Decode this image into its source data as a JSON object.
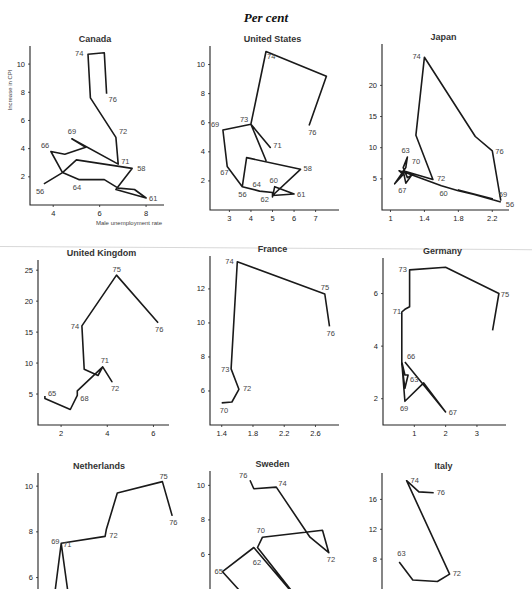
{
  "page": {
    "title": "Per cent"
  },
  "chart_data": [
    {
      "type": "line",
      "title": "Canada",
      "xlabel": "Male unemployment rate",
      "ylabel": "Increase in CPI",
      "xticks": [
        4,
        6,
        8
      ],
      "yticks": [
        2,
        4,
        6,
        8,
        10
      ],
      "xlim": [
        3,
        8.6
      ],
      "ylim": [
        0,
        11
      ],
      "box": [
        30,
        50,
        160,
        205
      ],
      "points": [
        [
          3.6,
          1.5
        ],
        [
          4.4,
          2.3
        ],
        [
          5.0,
          3.2
        ],
        [
          7.4,
          2.6
        ],
        [
          6.7,
          1.1
        ],
        [
          8.0,
          0.5
        ],
        [
          7.5,
          1.1
        ],
        [
          6.8,
          1.2
        ],
        [
          6.2,
          1.8
        ],
        [
          5.1,
          1.8
        ],
        [
          4.4,
          2.3
        ],
        [
          3.9,
          3.8
        ],
        [
          4.5,
          3.6
        ],
        [
          5.4,
          4.1
        ],
        [
          4.8,
          4.7
        ],
        [
          6.8,
          2.9
        ],
        [
          6.7,
          4.8
        ],
        [
          5.6,
          7.6
        ],
        [
          5.5,
          10.7
        ],
        [
          6.2,
          10.8
        ],
        [
          6.3,
          7.9
        ]
      ],
      "labels": [
        [
          "56",
          3.6,
          1.5,
          -8,
          10
        ],
        [
          "58",
          7.4,
          2.6,
          5,
          3
        ],
        [
          "61",
          8.0,
          0.5,
          3,
          3
        ],
        [
          "64",
          5.1,
          1.8,
          -6,
          10
        ],
        [
          "66",
          3.9,
          3.8,
          -10,
          -3
        ],
        [
          "69",
          4.8,
          4.7,
          -4,
          -5
        ],
        [
          "71",
          6.8,
          2.9,
          3,
          0
        ],
        [
          "72",
          6.7,
          4.8,
          3,
          -3
        ],
        [
          "74",
          5.5,
          10.7,
          -13,
          2
        ],
        [
          "76",
          6.3,
          7.9,
          2,
          8
        ]
      ]
    },
    {
      "type": "line",
      "title": "United States",
      "xlabel": "",
      "ylabel": "",
      "xticks": [
        3,
        4,
        5,
        6,
        7
      ],
      "yticks": [
        2,
        4,
        6,
        8,
        10
      ],
      "xlim": [
        2.1,
        7.9
      ],
      "ylim": [
        0,
        11
      ],
      "box": [
        210,
        50,
        335,
        210
      ],
      "points": [
        [
          3.6,
          1.6
        ],
        [
          3.8,
          3.6
        ],
        [
          6.3,
          2.8
        ],
        [
          5.0,
          1.0
        ],
        [
          6.0,
          1.1
        ],
        [
          5.1,
          1.6
        ],
        [
          5.0,
          0.9
        ],
        [
          5.0,
          1.2
        ],
        [
          4.4,
          1.3
        ],
        [
          3.6,
          1.6
        ],
        [
          2.9,
          3.0
        ],
        [
          2.7,
          5.5
        ],
        [
          4.0,
          5.9
        ],
        [
          4.9,
          4.3
        ],
        [
          4.0,
          5.9
        ],
        [
          4.7,
          3.4
        ],
        [
          4.0,
          5.9
        ],
        [
          4.7,
          10.9
        ],
        [
          7.5,
          9.2
        ],
        [
          6.7,
          5.8
        ]
      ],
      "labels": [
        [
          "56",
          3.6,
          1.6,
          -4,
          10
        ],
        [
          "58",
          6.3,
          2.8,
          3,
          2
        ],
        [
          "60",
          5.0,
          1.6,
          -3,
          -4
        ],
        [
          "61",
          6.0,
          1.1,
          3,
          3
        ],
        [
          "62",
          5.0,
          0.9,
          -12,
          5
        ],
        [
          "64",
          4.4,
          1.3,
          -7,
          -4
        ],
        [
          "67",
          2.9,
          3.0,
          -7,
          9
        ],
        [
          "69",
          2.7,
          5.5,
          -12,
          -3
        ],
        [
          "71",
          4.9,
          4.3,
          3,
          1
        ],
        [
          "73",
          4.0,
          5.9,
          -11,
          -2
        ],
        [
          "74",
          4.7,
          10.9,
          1,
          8
        ],
        [
          "76",
          6.7,
          5.8,
          -1,
          9
        ]
      ]
    },
    {
      "type": "line",
      "title": "Japan",
      "xlabel": "",
      "ylabel": "",
      "xticks": [
        1.0,
        1.4,
        1.8,
        2.2
      ],
      "yticks": [
        5,
        10,
        15,
        20
      ],
      "xlim": [
        0.9,
        2.35
      ],
      "ylim": [
        0,
        26
      ],
      "box": [
        382,
        48,
        505,
        210
      ],
      "points": [
        [
          2.3,
          1.3
        ],
        [
          1.8,
          3.2
        ],
        [
          2.2,
          1.8
        ],
        [
          1.8,
          3.1
        ],
        [
          1.6,
          3.9
        ],
        [
          1.2,
          5.9
        ],
        [
          1.1,
          6.3
        ],
        [
          1.15,
          5.7
        ],
        [
          1.05,
          4.2
        ],
        [
          1.18,
          6.8
        ],
        [
          1.2,
          8.5
        ],
        [
          1.15,
          6.8
        ],
        [
          1.2,
          5.2
        ],
        [
          1.25,
          5.6
        ],
        [
          1.18,
          4.3
        ],
        [
          1.15,
          6.3
        ],
        [
          1.5,
          4.9
        ],
        [
          1.3,
          12.0
        ],
        [
          1.4,
          24.5
        ],
        [
          2.0,
          11.8
        ],
        [
          2.2,
          9.5
        ],
        [
          2.3,
          1.5
        ]
      ],
      "labels": [
        [
          "56",
          2.3,
          1.5,
          5,
          6
        ],
        [
          "59",
          2.3,
          1.5,
          -2,
          -4
        ],
        [
          "60",
          1.6,
          3.9,
          -2,
          10
        ],
        [
          "63",
          1.2,
          8.5,
          -6,
          -4
        ],
        [
          "67",
          1.15,
          4.3,
          -5,
          10
        ],
        [
          "70",
          1.18,
          6.8,
          6,
          -4
        ],
        [
          "72",
          1.5,
          4.9,
          4,
          2
        ],
        [
          "74",
          1.4,
          24.5,
          -12,
          2
        ],
        [
          "76",
          2.2,
          9.5,
          3,
          3
        ]
      ]
    },
    {
      "type": "line",
      "title": "United Kingdom",
      "xlabel": "",
      "ylabel": "",
      "xticks": [
        2,
        4,
        6
      ],
      "yticks": [
        5,
        10,
        15,
        20,
        25
      ],
      "xlim": [
        1.0,
        6.5
      ],
      "ylim": [
        0,
        26
      ],
      "box": [
        38,
        264,
        165,
        425
      ],
      "points": [
        [
          1.3,
          4.7
        ],
        [
          1.3,
          4.3
        ],
        [
          2.4,
          2.5
        ],
        [
          2.7,
          4.8
        ],
        [
          2.7,
          5.5
        ],
        [
          3.8,
          9.4
        ],
        [
          4.2,
          7.0
        ],
        [
          3.8,
          9.4
        ],
        [
          3.6,
          8.0
        ],
        [
          3.0,
          9.0
        ],
        [
          2.9,
          16.0
        ],
        [
          4.4,
          24.2
        ],
        [
          6.2,
          16.5
        ]
      ],
      "labels": [
        [
          "65",
          1.3,
          4.7,
          3,
          0
        ],
        [
          "68",
          2.7,
          4.8,
          3,
          6
        ],
        [
          "71",
          3.8,
          9.4,
          -2,
          -4
        ],
        [
          "72",
          4.2,
          7.0,
          -1,
          9
        ],
        [
          "74",
          2.9,
          16.0,
          -11,
          3
        ],
        [
          "75",
          4.4,
          24.2,
          -4,
          -3
        ],
        [
          "76",
          6.2,
          16.5,
          -3,
          9
        ]
      ]
    },
    {
      "type": "line",
      "title": "France",
      "xlabel": "",
      "ylabel": "",
      "xticks": [
        1.4,
        1.8,
        2.2,
        2.6
      ],
      "yticks": [
        6,
        8,
        10,
        12
      ],
      "xlim": [
        1.25,
        2.85
      ],
      "ylim": [
        4.0,
        13.7
      ],
      "box": [
        210,
        260,
        335,
        425
      ],
      "points": [
        [
          1.4,
          5.3
        ],
        [
          1.53,
          5.35
        ],
        [
          1.62,
          6.1
        ],
        [
          1.52,
          7.3
        ],
        [
          1.6,
          13.6
        ],
        [
          2.72,
          11.7
        ],
        [
          2.78,
          9.8
        ]
      ],
      "labels": [
        [
          "70",
          1.4,
          5.3,
          -2,
          10
        ],
        [
          "72",
          1.62,
          6.1,
          4,
          2
        ],
        [
          "73",
          1.52,
          7.3,
          -10,
          3
        ],
        [
          "74",
          1.6,
          13.6,
          -12,
          2
        ],
        [
          "75",
          2.72,
          11.7,
          -4,
          -4
        ],
        [
          "76",
          2.78,
          9.8,
          -3,
          10
        ]
      ]
    },
    {
      "type": "line",
      "title": "Germany",
      "xlabel": "",
      "ylabel": "",
      "xticks": [
        1,
        2,
        3
      ],
      "yticks": [
        2,
        4,
        6
      ],
      "xlim": [
        0,
        3.8
      ],
      "ylim": [
        1.0,
        7.2
      ],
      "box": [
        383,
        262,
        502,
        425
      ],
      "points": [
        [
          0.7,
          3.4
        ],
        [
          2.0,
          1.5
        ],
        [
          1.3,
          2.6
        ],
        [
          0.7,
          1.9
        ],
        [
          0.6,
          3.4
        ],
        [
          0.7,
          2.9
        ],
        [
          0.8,
          2.9
        ],
        [
          0.7,
          2.4
        ],
        [
          0.6,
          3.3
        ],
        [
          0.6,
          5.3
        ],
        [
          0.7,
          5.4
        ],
        [
          0.85,
          5.5
        ],
        [
          0.85,
          6.9
        ],
        [
          2.0,
          7.0
        ],
        [
          3.7,
          6.0
        ],
        [
          3.5,
          4.6
        ]
      ],
      "labels": [
        [
          "63",
          0.8,
          2.9,
          2,
          7
        ],
        [
          "66",
          0.7,
          3.4,
          2,
          -3
        ],
        [
          "67",
          2.0,
          1.5,
          3,
          3
        ],
        [
          "69",
          0.7,
          1.9,
          -5,
          10
        ],
        [
          "71",
          0.6,
          5.3,
          -9,
          2
        ],
        [
          "73",
          0.85,
          6.9,
          -11,
          2
        ],
        [
          "75",
          3.7,
          6.0,
          2,
          3
        ]
      ]
    },
    {
      "type": "line",
      "title": "Netherlands",
      "xlabel": "",
      "ylabel": "",
      "xticks": [],
      "yticks": [
        6,
        8,
        10
      ],
      "xlim": [
        0,
        10
      ],
      "ylim": [
        5.5,
        10.4
      ],
      "box": [
        38,
        477,
        160,
        589
      ],
      "points": [
        [
          1.3,
          5.0
        ],
        [
          1.9,
          7.5
        ],
        [
          2.6,
          4.8
        ],
        [
          1.9,
          7.5
        ],
        [
          5.5,
          7.8
        ],
        [
          5.6,
          8.1
        ],
        [
          6.5,
          9.7
        ],
        [
          10.2,
          10.2
        ],
        [
          11.0,
          8.7
        ]
      ],
      "labels": [
        [
          "69",
          1.9,
          7.5,
          -10,
          1
        ],
        [
          "71",
          1.9,
          7.5,
          2,
          4
        ],
        [
          "72",
          5.6,
          7.8,
          3,
          2
        ],
        [
          "75",
          10.2,
          10.2,
          -3,
          -3
        ],
        [
          "76",
          11.0,
          8.7,
          -3,
          9
        ]
      ]
    },
    {
      "type": "line",
      "title": "Sweden",
      "xlabel": "",
      "ylabel": "",
      "xticks": [],
      "yticks": [
        6,
        8,
        10
      ],
      "xlim": [
        0,
        10
      ],
      "ylim": [
        4.0,
        10.6
      ],
      "box": [
        210,
        475,
        335,
        589
      ],
      "points": [
        [
          3.5,
          3.0
        ],
        [
          1.0,
          5.0
        ],
        [
          3.5,
          6.4
        ],
        [
          7.5,
          3.0
        ],
        [
          3.8,
          6.4
        ],
        [
          4.2,
          7.0
        ],
        [
          9.0,
          7.4
        ],
        [
          9.5,
          6.1
        ],
        [
          8.0,
          7.0
        ],
        [
          5.3,
          9.9
        ],
        [
          3.5,
          9.8
        ],
        [
          3.2,
          10.3
        ]
      ],
      "labels": [
        [
          "62",
          3.5,
          5.3,
          -1,
          -2
        ],
        [
          "65",
          1.0,
          5.0,
          -8,
          2
        ],
        [
          "67",
          7.5,
          3.0,
          3,
          -8
        ],
        [
          "70",
          4.2,
          7.0,
          -6,
          -4
        ],
        [
          "72",
          9.5,
          6.1,
          -2,
          9
        ],
        [
          "74",
          5.3,
          9.9,
          2,
          -1
        ],
        [
          "76",
          3.2,
          10.3,
          -11,
          -2
        ]
      ]
    },
    {
      "type": "line",
      "title": "Italy",
      "xlabel": "",
      "ylabel": "",
      "xticks": [],
      "yticks": [
        8,
        12,
        16
      ],
      "xlim": [
        0,
        10
      ],
      "ylim": [
        4.0,
        19.0
      ],
      "box": [
        382,
        477,
        505,
        589
      ],
      "points": [
        [
          1.4,
          7.6
        ],
        [
          2.5,
          5.2
        ],
        [
          4.5,
          5.0
        ],
        [
          5.5,
          6.0
        ],
        [
          2.0,
          18.5
        ],
        [
          3.0,
          17.0
        ],
        [
          4.2,
          16.9
        ]
      ],
      "labels": [
        [
          "63",
          1.4,
          7.6,
          -2,
          -6
        ],
        [
          "72",
          5.5,
          6.0,
          3,
          2
        ],
        [
          "74",
          2.0,
          18.5,
          4,
          2
        ],
        [
          "76",
          4.2,
          16.9,
          3,
          2
        ]
      ]
    }
  ]
}
